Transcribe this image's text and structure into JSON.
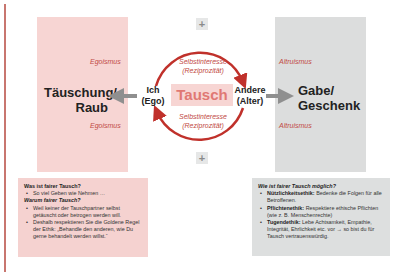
{
  "diagram": {
    "left_box": {
      "label_top": "Egoismus",
      "title_line1": "Täuschung/",
      "title_line2": "Raub",
      "label_bottom": "Egoismus",
      "color": "#f7d5d3"
    },
    "right_box": {
      "label_top": "Altruismus",
      "title_line1": "Gabe/",
      "title_line2": "Geschenk",
      "label_bottom": "Altruismus",
      "color": "#dcdddd"
    },
    "center": {
      "label": "Tausch",
      "self_interest_top_line1": "Selbstinteresse",
      "self_interest_top_line2": "(Reziprozität)",
      "self_interest_bottom_line1": "Selbstinteresse",
      "self_interest_bottom_line2": "(Reziprozität)",
      "plus_top": "+",
      "plus_bottom": "+",
      "accent_color": "#c0312b"
    },
    "ego_node": {
      "line1": "Ich",
      "line2": "(Ego)"
    },
    "alter_node": {
      "line1": "Andere",
      "line2": "(Alter)"
    }
  },
  "info_left": {
    "q1": "Was ist fairer Tausch?",
    "a1": "So viel Geben wie Nehmen …",
    "q2": "Warum fairer Tausch?",
    "bullets": [
      "Weil keiner der Tauschpartner selbst getäuscht oder betrogen werden will.",
      "Deshalb respektieren Sie die Goldene Regel der Ethik: „Behandle den anderen, wie Du gerne behandelt werden willst.“"
    ]
  },
  "info_right": {
    "q": "Wie ist fairer Tausch möglich?",
    "items": [
      {
        "term": "Nützlichkeitsethik:",
        "text": " Bedenke die Folgen für alle Betroffenen."
      },
      {
        "term": "Pflichtenethik:",
        "text": " Respektiere ethische Pflichten (wie z. B. Menschenrechte)"
      },
      {
        "term": "Tugendethik:",
        "text": " Lebe Achtsamkeit, Empathie, Integrität, Ehrlichkeit etc. vor → so bist du für Tausch vertrauenswürdig."
      }
    ]
  }
}
